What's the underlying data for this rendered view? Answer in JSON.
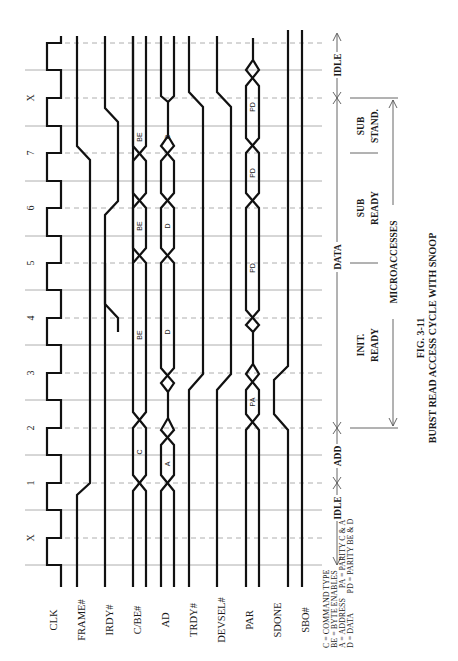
{
  "figure": {
    "number": "FIG. 3-11",
    "title": "BURST READ ACCESS CYCLE WITH SNOOP",
    "rotation_deg": -90
  },
  "clock_labels": [
    "X",
    "1",
    "2",
    "3",
    "4",
    "5",
    "6",
    "7",
    "X"
  ],
  "signals": [
    {
      "name": "CLK",
      "type": "clock"
    },
    {
      "name": "FRAME#",
      "type": "line"
    },
    {
      "name": "IRDY#",
      "type": "line"
    },
    {
      "name": "C/BE#",
      "type": "bus",
      "segments": [
        "C",
        "BE",
        "BE",
        "BE"
      ]
    },
    {
      "name": "AD",
      "type": "bus",
      "segments": [
        "A",
        "D",
        "D",
        "D"
      ]
    },
    {
      "name": "TRDY#",
      "type": "line"
    },
    {
      "name": "DEVSEL#",
      "type": "line"
    },
    {
      "name": "PAR",
      "type": "bus",
      "segments": [
        "PA",
        "PD",
        "PD",
        "PD"
      ]
    },
    {
      "name": "SDONE",
      "type": "line"
    },
    {
      "name": "SBO#",
      "type": "line"
    }
  ],
  "phases": {
    "bus": [
      {
        "label": "IDLE"
      },
      {
        "label": "ADD"
      },
      {
        "label": "DATA"
      },
      {
        "label": "IDLE"
      }
    ],
    "microaccesses_label": "MICROACCESSES",
    "micro": [
      {
        "label_line1": "INIT.",
        "label_line2": "READY"
      },
      {
        "label_line1": "SUB",
        "label_line2": "READY"
      },
      {
        "label_line1": "SUB",
        "label_line2": "STAND."
      }
    ]
  },
  "legend": {
    "lines": [
      "C = COMMAND TYPE",
      "BE = BYTE ENABLES",
      "A = ADDRESS     PA = PARITY C & A",
      "D = DATA          PD = PARITY BE & D"
    ]
  },
  "colors": {
    "signal": "#111111",
    "grid": "#9a9a9a",
    "background": "#ffffff"
  }
}
